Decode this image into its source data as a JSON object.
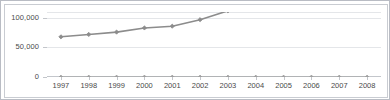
{
  "chart_data": {
    "type": "line",
    "title": "",
    "subtitle": "",
    "xlabel": "",
    "ylabel": "",
    "categories": [
      "1997",
      "1998",
      "1999",
      "2000",
      "2001",
      "2002",
      "2003",
      "2004",
      "2005",
      "2006",
      "2007",
      "2008"
    ],
    "x": [
      1997,
      1998,
      1999,
      2000,
      2001,
      2002,
      2003,
      2004,
      2005,
      2006,
      2007,
      2008
    ],
    "ylim": [
      0,
      110000
    ],
    "xlim": [
      "1997",
      "2008"
    ],
    "ytick_labels": [
      "0",
      "50,000",
      "100,000"
    ],
    "ytick_values": [
      0,
      50000,
      100000
    ],
    "grid": true,
    "legend": "none",
    "series": [
      {
        "name": "series-1",
        "color": "#8c8c8c",
        "marker": "diamond",
        "clipped_at_top": true,
        "values": [
          68000,
          72000,
          76000,
          83000,
          86000,
          97000,
          112000,
          null,
          null,
          null,
          null,
          null
        ]
      },
      {
        "name": "series-2",
        "color": "#a0a0a0",
        "marker": "diamond",
        "clipped_at_top": false,
        "values": [
          0,
          0,
          0,
          0,
          0,
          0,
          0,
          0,
          0,
          0,
          0,
          0
        ]
      }
    ],
    "annotations": []
  },
  "axes": {
    "y": {
      "ticks": [
        {
          "label": "100,000",
          "value": 100000
        },
        {
          "label": "50,000",
          "value": 50000
        },
        {
          "label": "0",
          "value": 0
        }
      ]
    },
    "x": {
      "ticks": [
        {
          "label": "1997"
        },
        {
          "label": "1998"
        },
        {
          "label": "1999"
        },
        {
          "label": "2000"
        },
        {
          "label": "2001"
        },
        {
          "label": "2002"
        },
        {
          "label": "2003"
        },
        {
          "label": "2004"
        },
        {
          "label": "2005"
        },
        {
          "label": "2006"
        },
        {
          "label": "2007"
        },
        {
          "label": "2008"
        }
      ]
    }
  },
  "colors": {
    "series_line": "#8c8c8c",
    "gridline": "#e4e6e9",
    "axis": "#c3c6cb",
    "text": "#4a4a4a",
    "frame": "#b9bcc4",
    "background": "#ffffff"
  }
}
